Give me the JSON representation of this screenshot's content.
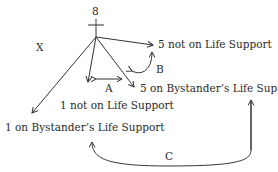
{
  "diagram": {
    "root_label": "8",
    "side_label": "X",
    "nodes": {
      "five_not": "5 not on Life Support",
      "five_on": "5 on Bystander’s Life Support",
      "one_not": "1 not on Life Support",
      "one_on": "1 on Bystander’s Life Support"
    },
    "relations": {
      "a": "A",
      "b": "B",
      "c": "C"
    },
    "line_color": "#333333"
  }
}
